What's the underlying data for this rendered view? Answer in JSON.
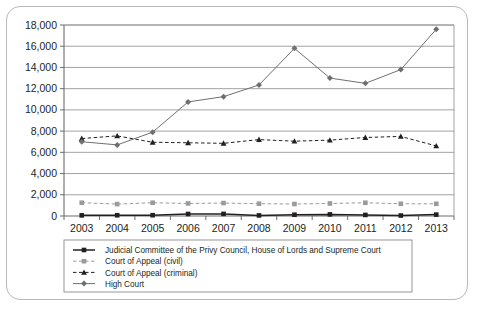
{
  "chart_data": {
    "type": "line",
    "title": "",
    "subtitle": "",
    "xlabel": "",
    "ylabel": "",
    "categories": [
      "2003",
      "2004",
      "2005",
      "2006",
      "2007",
      "2008",
      "2009",
      "2010",
      "2011",
      "2012",
      "2013"
    ],
    "x": [
      2003,
      2004,
      2005,
      2006,
      2007,
      2008,
      2009,
      2010,
      2011,
      2012,
      2013
    ],
    "ylim": [
      0,
      18000
    ],
    "yticks": [
      0,
      2000,
      4000,
      6000,
      8000,
      10000,
      12000,
      14000,
      16000,
      18000
    ],
    "ytick_labels": [
      "0",
      "2,000",
      "4,000",
      "6,000",
      "8,000",
      "10,000",
      "12,000",
      "14,000",
      "16,000",
      "18,000"
    ],
    "grid": true,
    "legend_position": "below",
    "series": [
      {
        "name": "Judicial Committee of the Privy Council, House of Lords and Supreme Court",
        "marker": "square",
        "color": "#231f20",
        "linestyle": "solid",
        "values": [
          60,
          70,
          75,
          190,
          200,
          55,
          120,
          150,
          100,
          45,
          130
        ]
      },
      {
        "name": "Court of Appeal (civil)",
        "marker": "square",
        "color": "#9a9a9a",
        "linestyle": "dashed",
        "values": [
          1250,
          1120,
          1250,
          1180,
          1220,
          1160,
          1130,
          1180,
          1250,
          1150,
          1150
        ]
      },
      {
        "name": "Court of Appeal (criminal)",
        "marker": "triangle",
        "color": "#231f20",
        "linestyle": "dashed",
        "values": [
          7300,
          7550,
          6950,
          6900,
          6850,
          7200,
          7050,
          7150,
          7400,
          7500,
          6600
        ]
      },
      {
        "name": "High Court",
        "marker": "diamond",
        "color": "#6f6f6f",
        "linestyle": "solid",
        "values": [
          7000,
          6700,
          7900,
          10750,
          11250,
          12350,
          15800,
          13000,
          12500,
          13800,
          17600
        ]
      }
    ]
  },
  "legend": {
    "entries": [
      {
        "label": "Judicial Committee of the Privy Council, House of Lords and Supreme Court"
      },
      {
        "label": "Court of Appeal (civil)"
      },
      {
        "label": "Court of Appeal (criminal)"
      },
      {
        "label": "High Court"
      }
    ]
  }
}
